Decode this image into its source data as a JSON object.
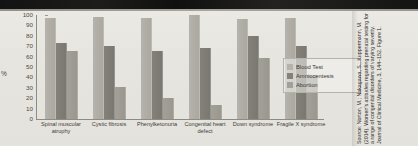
{
  "chart_data": {
    "type": "bar",
    "title": "",
    "xlabel": "",
    "ylabel": "%",
    "ylim": [
      0,
      100
    ],
    "grid": false,
    "legend_position": "right",
    "categories": [
      "Spinal muscular atrophy",
      "Cystic fibrosis",
      "Phenylketonuria",
      "Congenital heart defect",
      "Down syndrome",
      "Fragile X syndrome"
    ],
    "yticks": [
      "100",
      "90",
      "80",
      "70",
      "60",
      "50",
      "40",
      "30",
      "20",
      "10",
      "0"
    ],
    "series": [
      {
        "name": "Blood Test",
        "color": "#b6b3ac",
        "values": [
          97,
          98,
          97,
          100,
          96,
          97
        ]
      },
      {
        "name": "Amniocentesis",
        "color": "#84817a",
        "values": [
          73,
          70,
          65,
          68,
          80,
          70
        ]
      },
      {
        "name": "Abortion",
        "color": "#a3a099",
        "values": [
          65,
          31,
          20,
          13,
          59,
          42
        ]
      }
    ]
  },
  "legend": {
    "items": [
      {
        "label": "Blood Test"
      },
      {
        "label": "Amniocentesis"
      },
      {
        "label": "Abortion"
      }
    ]
  },
  "citation": {
    "text": "Source: Norton, M.; Nakagawa, S.; Kuppermann, M. (2014). Women's attitudes regarding prenatal testing for a range of congenital disorders of varying severity. Journal of Clinical Medicine, 3, 144–152. Figure 1."
  }
}
